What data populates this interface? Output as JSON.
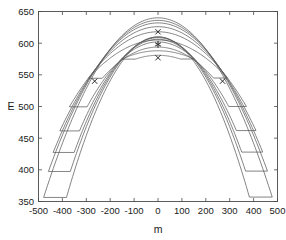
{
  "figure": {
    "background_color": "#ffffff",
    "axes_color": "#4a4a4a",
    "contour_color": "#5b5b5b",
    "marker_color": "#1f1f1f"
  },
  "chart_data": {
    "type": "line",
    "title": "",
    "subtitle": "",
    "xlabel": "m",
    "ylabel": "E",
    "xlim": [
      -500,
      500
    ],
    "ylim": [
      350,
      650
    ],
    "xticks": [
      -500,
      -400,
      -300,
      -200,
      -100,
      0,
      100,
      200,
      300,
      400,
      500
    ],
    "xtick_labels": [
      "-500",
      "-400",
      "-300",
      "-200",
      "-100",
      "0",
      "100",
      "200",
      "300",
      "400",
      "500"
    ],
    "yticks": [
      350,
      400,
      450,
      500,
      550,
      600,
      650
    ],
    "ytick_labels": [
      "350",
      "400",
      "450",
      "500",
      "550",
      "600",
      "650"
    ],
    "grid": false,
    "legend": null,
    "contours": [
      {
        "level_index": 1,
        "apex_y": 588,
        "half_width": 150,
        "bottom_y": 575,
        "closed": true
      },
      {
        "level_index": 2,
        "apex_y": 605,
        "half_width": 290,
        "bottom_y": 545,
        "closed": true
      },
      {
        "level_index": 3,
        "apex_y": 618,
        "half_width": 370,
        "bottom_y": 500,
        "closed": true
      },
      {
        "level_index": 4,
        "apex_y": 626,
        "half_width": 410,
        "bottom_y": 462,
        "closed": true
      },
      {
        "level_index": 5,
        "apex_y": 632,
        "half_width": 438,
        "bottom_y": 428,
        "closed": true
      },
      {
        "level_index": 6,
        "apex_y": 636,
        "half_width": 458,
        "bottom_y": 398,
        "closed": true
      },
      {
        "level_index": 7,
        "apex_y": 640,
        "half_width": 478,
        "bottom_y": 357,
        "closed": true
      }
    ],
    "markers": [
      {
        "name": "optimum",
        "symbol": "asterisk",
        "x": 0,
        "y": 598
      },
      {
        "name": "upper-bound",
        "symbol": "cross",
        "x": 0,
        "y": 618
      },
      {
        "name": "lower-bound",
        "symbol": "cross",
        "x": 0,
        "y": 577
      },
      {
        "name": "left-bound",
        "symbol": "cross",
        "x": -265,
        "y": 540
      },
      {
        "name": "right-bound",
        "symbol": "cross",
        "x": 270,
        "y": 540
      }
    ]
  }
}
